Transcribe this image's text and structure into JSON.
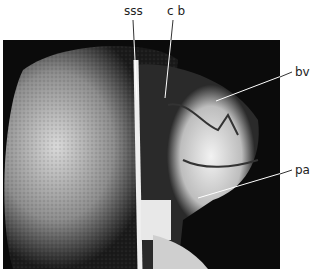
{
  "figure": {
    "labels": [
      {
        "id": "sss",
        "text": "sss"
      },
      {
        "id": "cb",
        "text": "c b"
      },
      {
        "id": "bv",
        "text": "bv"
      },
      {
        "id": "pa",
        "text": "pa"
      }
    ]
  }
}
